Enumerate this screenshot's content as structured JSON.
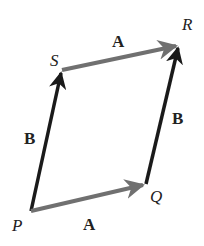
{
  "diagram": {
    "type": "vector-parallelogram",
    "points": {
      "P": {
        "label": "P",
        "x": 31,
        "y": 211
      },
      "Q": {
        "label": "Q",
        "x": 146,
        "y": 184
      },
      "R": {
        "label": "R",
        "x": 179,
        "y": 45
      },
      "S": {
        "label": "S",
        "x": 62,
        "y": 70
      }
    },
    "vectors": [
      {
        "id": "PQ",
        "label": "A",
        "from": "P",
        "to": "Q",
        "color": "#707070"
      },
      {
        "id": "SR",
        "label": "A",
        "from": "S",
        "to": "R",
        "color": "#707070"
      },
      {
        "id": "PS",
        "label": "B",
        "from": "P",
        "to": "S",
        "color": "#1a1a1a"
      },
      {
        "id": "QR",
        "label": "B",
        "from": "Q",
        "to": "R",
        "color": "#1a1a1a"
      }
    ],
    "labels": {
      "P": "P",
      "Q": "Q",
      "R": "R",
      "S": "S",
      "A_top": "A",
      "A_bottom": "A",
      "B_left": "B",
      "B_right": "B"
    }
  }
}
